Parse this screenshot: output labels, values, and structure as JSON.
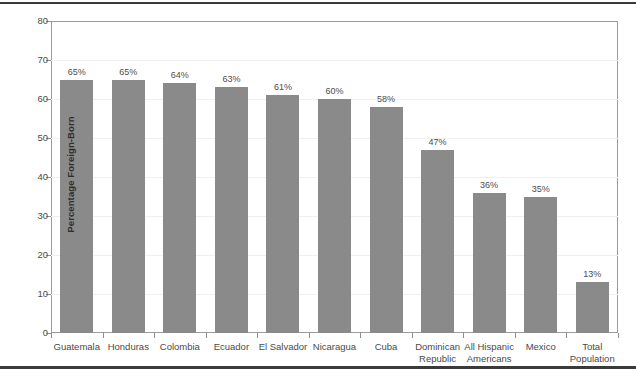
{
  "chart_data": {
    "type": "bar",
    "title": "",
    "xlabel": "",
    "ylabel": "Percentage Foreign-Born",
    "ylim": [
      0,
      80
    ],
    "yticks": [
      0,
      10,
      20,
      30,
      40,
      50,
      60,
      70,
      80
    ],
    "ytick_labels": [
      "0",
      "10",
      "20",
      "30",
      "40",
      "50",
      "60",
      "70",
      "80"
    ],
    "grid": true,
    "legend": null,
    "bar_color": "#8a8a8a",
    "categories": [
      "Guatemala",
      "Honduras",
      "Colombia",
      "Ecuador",
      "El Salvador",
      "Nicaragua",
      "Cuba",
      "Dominican Republic",
      "All Hispanic Americans",
      "Mexico",
      "Total Population"
    ],
    "category_lines": [
      [
        "Guatemala"
      ],
      [
        "Honduras"
      ],
      [
        "Colombia"
      ],
      [
        "Ecuador"
      ],
      [
        "El Salvador"
      ],
      [
        "Nicaragua"
      ],
      [
        "Cuba"
      ],
      [
        "Dominican",
        "Republic"
      ],
      [
        "All Hispanic",
        "Americans"
      ],
      [
        "Mexico"
      ],
      [
        "Total",
        "Population"
      ]
    ],
    "values": [
      65,
      65,
      64,
      63,
      61,
      60,
      58,
      47,
      36,
      35,
      13
    ],
    "data_labels": [
      "65%",
      "65%",
      "64%",
      "63%",
      "61%",
      "60%",
      "58%",
      "47%",
      "36%",
      "35%",
      "13%"
    ]
  }
}
